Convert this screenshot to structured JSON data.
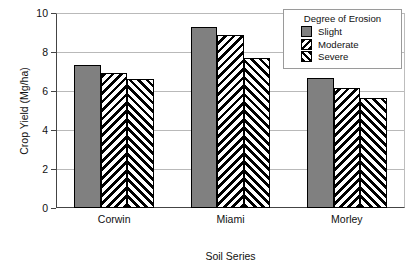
{
  "chart_data": {
    "type": "bar",
    "title": "",
    "subtitle": "",
    "xlabel": "Soil Series",
    "ylabel": "Crop Yield (Mg/ha)",
    "categories": [
      "Corwin",
      "Miami",
      "Morley"
    ],
    "series": [
      {
        "name": "Slight",
        "pattern": "solid-gray",
        "values": [
          7.35,
          9.3,
          6.65
        ]
      },
      {
        "name": "Moderate",
        "pattern": "backslash-hatch",
        "values": [
          6.9,
          8.85,
          6.15
        ]
      },
      {
        "name": "Severe",
        "pattern": "forwardslash-hatch",
        "values": [
          6.6,
          7.7,
          5.65
        ]
      }
    ],
    "ylim": [
      0,
      10
    ],
    "yticks": [
      0,
      2,
      4,
      6,
      8,
      10
    ],
    "ytick_labels": [
      "0",
      "2",
      "4",
      "6",
      "8",
      "10"
    ],
    "grid": true,
    "grid_axis": "y",
    "legend_position": "top-right",
    "legend_title": "Degree of Erosion",
    "colors": {
      "bar_slight": "#808080",
      "bar_outline": "#000000",
      "hatch": "#000000",
      "background": "#ffffff",
      "gridline": "#b9b9b9",
      "axis": "#444444",
      "text": "#111111"
    }
  },
  "legend": {
    "title": "Degree of Erosion",
    "items": [
      {
        "label": "Slight"
      },
      {
        "label": "Moderate"
      },
      {
        "label": "Severe"
      }
    ]
  },
  "axes": {
    "y_title": "Crop Yield (Mg/ha)",
    "x_title": "Soil Series",
    "y_ticks": [
      {
        "label": "10"
      },
      {
        "label": "8"
      },
      {
        "label": "6"
      },
      {
        "label": "4"
      },
      {
        "label": "2"
      },
      {
        "label": "0"
      }
    ],
    "x_categories": [
      {
        "label": "Corwin"
      },
      {
        "label": "Miami"
      },
      {
        "label": "Morley"
      }
    ]
  }
}
